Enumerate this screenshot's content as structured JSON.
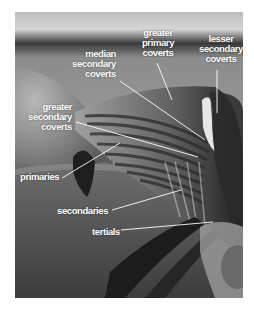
{
  "figure": {
    "photo_tone": "grayscale",
    "label_color": "#ffffff",
    "line_color": "#ffffff"
  },
  "labels": {
    "greater_primary_coverts": [
      "greater",
      "primary",
      "coverts"
    ],
    "lesser_secondary_coverts": [
      "lesser",
      "secondary",
      "coverts"
    ],
    "median_secondary_coverts": [
      "median",
      "secondary",
      "coverts"
    ],
    "greater_secondary_coverts": [
      "greater",
      "secondary",
      "coverts"
    ],
    "primaries": "primaries",
    "secondaries": "secondaries",
    "tertials": "tertials"
  }
}
